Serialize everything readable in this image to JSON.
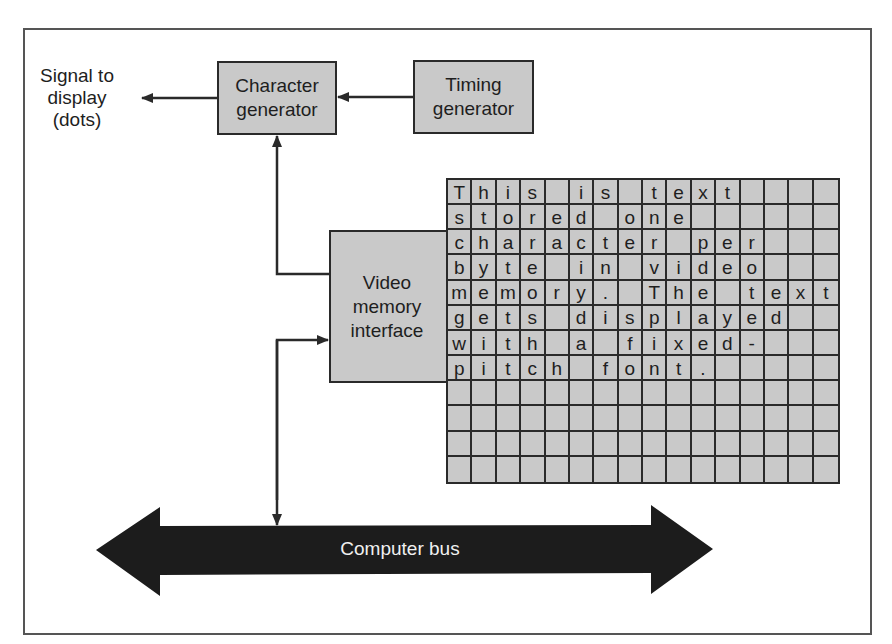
{
  "diagram": {
    "type": "block-diagram",
    "signal_label": [
      "Signal to",
      "display",
      "(dots)"
    ],
    "blocks": {
      "character_generator": [
        "Character",
        "generator"
      ],
      "timing_generator": [
        "Timing",
        "generator"
      ],
      "video_memory_interface": [
        "Video",
        "memory",
        "interface"
      ]
    },
    "bus_label": "Computer bus",
    "memory_grid": {
      "columns": 16,
      "rows": 12,
      "cells": [
        [
          "T",
          "h",
          "i",
          "s",
          "",
          "i",
          "s",
          "",
          "t",
          "e",
          "x",
          "t",
          "",
          "",
          "",
          ""
        ],
        [
          "s",
          "t",
          "o",
          "r",
          "e",
          "d",
          "",
          "o",
          "n",
          "e",
          "",
          "",
          "",
          "",
          "",
          ""
        ],
        [
          "c",
          "h",
          "a",
          "r",
          "a",
          "c",
          "t",
          "e",
          "r",
          "",
          "p",
          "e",
          "r",
          "",
          "",
          ""
        ],
        [
          "b",
          "y",
          "t",
          "e",
          "",
          "i",
          "n",
          "",
          "v",
          "i",
          "d",
          "e",
          "o",
          "",
          "",
          ""
        ],
        [
          "m",
          "e",
          "m",
          "o",
          "r",
          "y",
          ".",
          "",
          "T",
          "h",
          "e",
          "",
          "t",
          "e",
          "x",
          "t"
        ],
        [
          "g",
          "e",
          "t",
          "s",
          "",
          "d",
          "i",
          "s",
          "p",
          "l",
          "a",
          "y",
          "e",
          "d",
          "",
          ""
        ],
        [
          "w",
          "i",
          "t",
          "h",
          "",
          "a",
          "",
          "f",
          "i",
          "x",
          "e",
          "d",
          "-",
          "",
          "",
          ""
        ],
        [
          "p",
          "i",
          "t",
          "c",
          "h",
          "",
          "f",
          "o",
          "n",
          "t",
          ".",
          "",
          "",
          "",
          "",
          ""
        ],
        [
          "",
          "",
          "",
          "",
          "",
          "",
          "",
          "",
          "",
          "",
          "",
          "",
          "",
          "",
          "",
          ""
        ],
        [
          "",
          "",
          "",
          "",
          "",
          "",
          "",
          "",
          "",
          "",
          "",
          "",
          "",
          "",
          "",
          ""
        ],
        [
          "",
          "",
          "",
          "",
          "",
          "",
          "",
          "",
          "",
          "",
          "",
          "",
          "",
          "",
          "",
          ""
        ],
        [
          "",
          "",
          "",
          "",
          "",
          "",
          "",
          "",
          "",
          "",
          "",
          "",
          "",
          "",
          "",
          ""
        ]
      ]
    },
    "colors": {
      "box_fill": "#c9c9c9",
      "line": "#2a2a2a",
      "bus_fill": "#1c1c1c",
      "bus_text": "#f0f0f0"
    }
  }
}
